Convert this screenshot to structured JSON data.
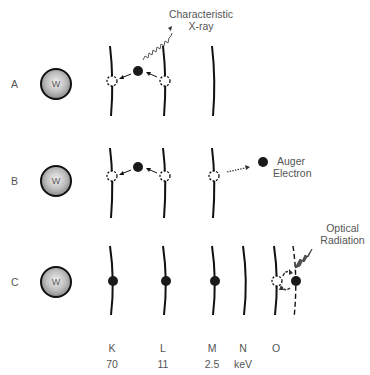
{
  "figure": {
    "nucleus_symbol": "W",
    "rows": [
      {
        "id": "A",
        "label": "A",
        "annotation": [
          "Characteristic",
          "X-ray"
        ]
      },
      {
        "id": "B",
        "label": "B",
        "annotation": [
          "Auger",
          "Electron"
        ]
      },
      {
        "id": "C",
        "label": "C",
        "annotation": [
          "Optical",
          "Radiation"
        ]
      }
    ],
    "shells": [
      {
        "name": "K",
        "energy": "70"
      },
      {
        "name": "L",
        "energy": "11"
      },
      {
        "name": "M",
        "energy": "2.5"
      },
      {
        "name": "N",
        "energy": "keV"
      },
      {
        "name": "O",
        "energy": ""
      }
    ],
    "colors": {
      "line": "#111111",
      "text": "#555555",
      "electron": "#1a1a1a"
    }
  }
}
